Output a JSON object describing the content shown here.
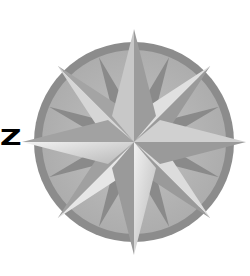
{
  "figure": {
    "label_letter": "Z",
    "points": 16,
    "colors": {
      "background": "#ffffff",
      "ring": "#8c8c8c",
      "disc": "#b4b4b4",
      "dark_facet": "#8a8a8a",
      "mid_facet": "#a6a6a6",
      "light_facet": "#e2e2e2",
      "letter": "#000000"
    }
  }
}
